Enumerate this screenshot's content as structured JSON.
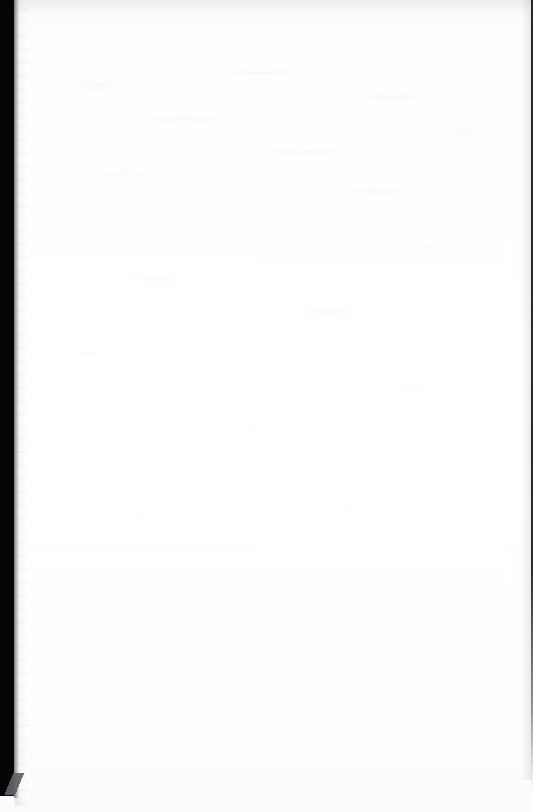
{
  "page": {
    "kind": "scanned-blank-page",
    "width": 533,
    "height": 812,
    "content_text": "",
    "body_text_present": "none",
    "page_number_text": "",
    "header_text": "",
    "footer_text": ""
  },
  "colors": {
    "paper": "#fefefe",
    "paper_top_tint": "#fafafa",
    "paper_bottom_tint": "#fbfbfb",
    "gutter_band": "#050505",
    "gutter_strip": "#a8aab0",
    "corner_wedge": "#606268",
    "right_edge_line": "#141418",
    "ghost_texture": "#787c86"
  },
  "artifacts": {
    "left_gutter_band": {
      "name": "scanner-gutter-shadow",
      "x": 0,
      "y": 0,
      "width": 14,
      "height": 796
    },
    "left_gutter_strip": {
      "name": "page-gutter-shading",
      "x": 15,
      "y": 0,
      "width": 12,
      "height": 806
    },
    "bottom_left_wedge": {
      "name": "corner-fold-wedge",
      "x": 0,
      "y": 773,
      "width": 30,
      "height": 22
    },
    "right_edge_line": {
      "name": "page-right-edge-line",
      "x": 531,
      "y": 0,
      "width": 2,
      "height": 790
    },
    "show_through_texture": {
      "name": "reverse-side-show-through",
      "x": 40,
      "y": 60,
      "width": 480,
      "height": 420
    }
  }
}
